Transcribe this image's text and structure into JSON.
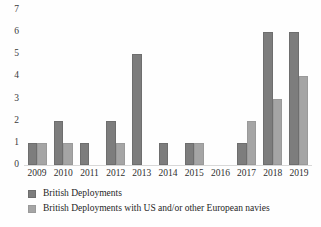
{
  "chart_data": {
    "type": "bar",
    "title": "",
    "subtitle": "",
    "xlabel": "",
    "ylabel": "",
    "categories": [
      "2009",
      "2010",
      "2011",
      "2012",
      "2013",
      "2014",
      "2015",
      "2016",
      "2017",
      "2018",
      "2019"
    ],
    "series": [
      {
        "name": "British Deployments",
        "color": "#7d7d7d",
        "values": [
          1,
          2,
          1,
          2,
          5,
          1,
          1,
          0,
          1,
          6,
          6
        ]
      },
      {
        "name": "British Deployments with US and/or other European navies",
        "color": "#a5a5a5",
        "values": [
          1,
          1,
          0,
          1,
          0,
          0,
          1,
          0,
          2,
          3,
          4
        ]
      }
    ],
    "ylim": [
      0,
      7
    ],
    "ytick_labels": [
      "7",
      "6",
      "5",
      "4",
      "3",
      "2",
      "1",
      "0"
    ],
    "ytick_values": [
      7,
      6,
      5,
      4,
      3,
      2,
      1,
      0
    ],
    "grid": false,
    "legend_position": "bottom-left",
    "background_color": "#ffffff"
  },
  "legend": {
    "items": [
      {
        "label": "British Deployments"
      },
      {
        "label": "British Deployments with US and/or other European navies"
      }
    ]
  }
}
